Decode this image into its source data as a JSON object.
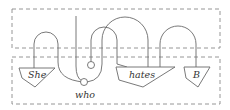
{
  "diagram": {
    "type": "string-diagram",
    "frames": [
      {
        "name": "upper-frame",
        "style": "dashed"
      },
      {
        "name": "lower-frame",
        "style": "dashed"
      }
    ],
    "boxes": [
      {
        "id": "she",
        "label": "She",
        "shape": "triangle-down"
      },
      {
        "id": "hates",
        "label": "hates",
        "shape": "triangle-down"
      },
      {
        "id": "b",
        "label": "B",
        "shape": "triangle-down"
      }
    ],
    "nodes": [
      {
        "id": "who",
        "label": "who",
        "shape": "circle"
      },
      {
        "id": "unit",
        "label": "",
        "shape": "circle"
      }
    ]
  },
  "labels": {
    "she": "She",
    "hates": "hates",
    "b": "B",
    "who": "who"
  },
  "colors": {
    "wire": "#6a6a6a",
    "frame": "#8a8a8a",
    "text": "#333333"
  }
}
